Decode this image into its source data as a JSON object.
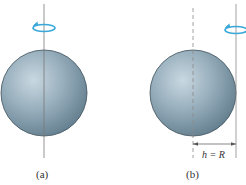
{
  "figure": {
    "panels": [
      {
        "id": "a",
        "label": "(a)",
        "description": "Sphere rotating about axis through its center",
        "axis": "solid line through sphere center"
      },
      {
        "id": "b",
        "label": "(b)",
        "description": "Sphere rotating about axis tangent to its surface",
        "axis": "solid line tangent to sphere; dashed line through center",
        "dimension_label": "h = R"
      }
    ],
    "colors": {
      "sphere_light": "#c5d5de",
      "sphere_mid": "#8ea6b5",
      "sphere_dark": "#5d7888",
      "outline": "#3e4f5a",
      "axis": "#8a8a8a",
      "rotation_arrow": "#39a8d8"
    }
  }
}
